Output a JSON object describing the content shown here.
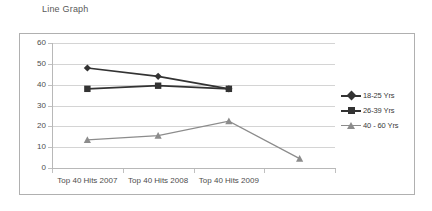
{
  "title": "Line Graph",
  "colors": {
    "series_dark": "#333333",
    "series_gray": "#8c8c8c",
    "gridline": "#d4d4d4",
    "axis": "#b8b8b8",
    "frame_border": "#b0b0b0",
    "text": "#4d4d4d",
    "title_text": "#595959",
    "background": "#ffffff"
  },
  "axes": {
    "y_ticks": [
      "0",
      "10",
      "20",
      "30",
      "40",
      "50",
      "60"
    ],
    "x_ticks": [
      "Top 40 Hits 2007",
      "Top 40 Hits 2008",
      "Top 40 Hits 2009",
      ""
    ]
  },
  "legend": {
    "items": [
      {
        "label": "18-25 Yrs",
        "marker": "diamond-marker",
        "color": "#333333"
      },
      {
        "label": "26-39 Yrs",
        "marker": "square-marker",
        "color": "#333333"
      },
      {
        "label": "40 - 60 Yrs",
        "marker": "triangle-marker",
        "color": "#8c8c8c"
      }
    ]
  },
  "chart_data": {
    "type": "line",
    "title": "Line Graph",
    "xlabel": "",
    "ylabel": "",
    "ylim": [
      0,
      60
    ],
    "ytick_step": 10,
    "grid": true,
    "legend_position": "right",
    "categories": [
      "Top 40 Hits 2007",
      "Top 40 Hits 2008",
      "Top 40 Hits 2009",
      ""
    ],
    "series": [
      {
        "name": "18-25 Yrs",
        "color": "#333333",
        "marker": "diamond",
        "values": [
          48,
          44,
          38,
          null
        ]
      },
      {
        "name": "26-39 Yrs",
        "color": "#333333",
        "marker": "square",
        "values": [
          38,
          39.5,
          38,
          null
        ]
      },
      {
        "name": "40 - 60 Yrs",
        "color": "#8c8c8c",
        "marker": "triangle",
        "values": [
          13.5,
          15.5,
          22.5,
          4.5
        ]
      }
    ]
  }
}
